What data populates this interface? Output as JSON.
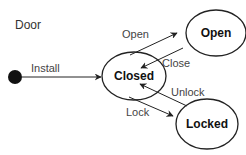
{
  "diagram": {
    "title": "Door",
    "initial": {
      "label": "initial-state"
    },
    "states": [
      {
        "id": "closed",
        "label": "Closed"
      },
      {
        "id": "open",
        "label": "Open"
      },
      {
        "id": "locked",
        "label": "Locked"
      }
    ],
    "transitions": [
      {
        "from": "initial",
        "to": "closed",
        "label": "Install"
      },
      {
        "from": "closed",
        "to": "open",
        "label": "Open"
      },
      {
        "from": "open",
        "to": "closed",
        "label": "Close"
      },
      {
        "from": "closed",
        "to": "locked",
        "label": "Lock"
      },
      {
        "from": "locked",
        "to": "closed",
        "label": "Unlock"
      }
    ],
    "colors": {
      "stroke": "#222222",
      "text": "#444444",
      "background": "#ffffff"
    }
  }
}
